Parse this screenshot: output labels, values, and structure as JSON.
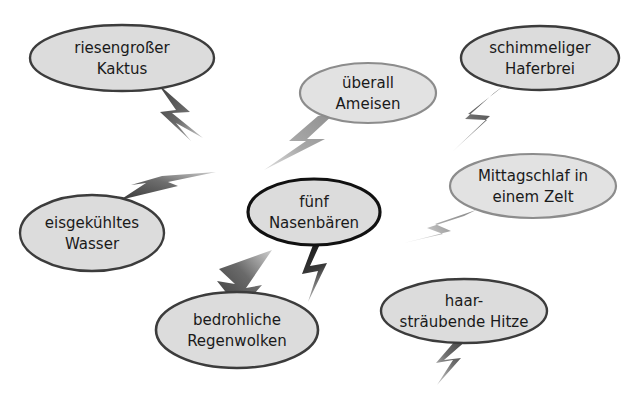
{
  "page": {
    "background_color": "#ffffff",
    "width": 631,
    "height": 401
  },
  "palette": {
    "bubble_fill": "#dcdcdc",
    "bubble_fill_light": "#e2e2e2",
    "border_dark": "#3c3c3c",
    "border_black": "#111111",
    "border_gray": "#8c8c8c",
    "bolt_dark": "#3f3f3f",
    "bolt_black": "#141414",
    "bolt_gray": "#8f8f8f",
    "text_color": "#1a1a1a"
  },
  "bubbles": [
    {
      "id": "riesengrosser-kaktus",
      "lines": [
        "riesengroßer",
        "Kaktus"
      ],
      "cx": 122,
      "cy": 58,
      "rx": 92,
      "ry": 33,
      "font_size": 15,
      "border_color": "#3c3c3c",
      "border_width": 2.4,
      "fill": "#dcdcdc"
    },
    {
      "id": "ueberall-ameisen",
      "lines": [
        "überall",
        "Ameisen"
      ],
      "cx": 368,
      "cy": 93,
      "rx": 68,
      "ry": 30,
      "font_size": 15,
      "border_color": "#8c8c8c",
      "border_width": 2.2,
      "fill": "#e2e2e2"
    },
    {
      "id": "schimmeliger-haferbrei",
      "lines": [
        "schimmeliger",
        "Haferbrei"
      ],
      "cx": 540,
      "cy": 58,
      "rx": 79,
      "ry": 32,
      "font_size": 15,
      "border_color": "#3c3c3c",
      "border_width": 2.4,
      "fill": "#dcdcdc"
    },
    {
      "id": "mittagschlaf-im-zelt",
      "lines": [
        "Mittagschlaf in",
        "einem Zelt"
      ],
      "cx": 533,
      "cy": 186,
      "rx": 83,
      "ry": 32,
      "font_size": 15,
      "border_color": "#8c8c8c",
      "border_width": 2.2,
      "fill": "#e2e2e2"
    },
    {
      "id": "fuenf-nasenbaeren",
      "lines": [
        "fünf",
        "Nasenbären"
      ],
      "cx": 314,
      "cy": 212,
      "rx": 66,
      "ry": 33,
      "font_size": 15,
      "border_color": "#111111",
      "border_width": 3.2,
      "fill": "#dcdcdc"
    },
    {
      "id": "eisgekuehltes-wasser",
      "lines": [
        "eisgekühltes",
        "Wasser"
      ],
      "cx": 92,
      "cy": 233,
      "rx": 72,
      "ry": 38,
      "font_size": 15,
      "border_color": "#3c3c3c",
      "border_width": 2.4,
      "fill": "#dcdcdc"
    },
    {
      "id": "bedrohliche-regenwolken",
      "lines": [
        "bedrohliche",
        "Regenwolken"
      ],
      "cx": 237,
      "cy": 330,
      "rx": 81,
      "ry": 38,
      "font_size": 15,
      "border_color": "#3c3c3c",
      "border_width": 2.6,
      "fill": "#dcdcdc"
    },
    {
      "id": "haarstraeubende-hitze",
      "lines": [
        "haar-",
        "sträubende Hitze"
      ],
      "cx": 464,
      "cy": 311,
      "rx": 83,
      "ry": 32,
      "font_size": 15,
      "border_color": "#3c3c3c",
      "border_width": 2.4,
      "fill": "#dcdcdc"
    }
  ],
  "bolts": [
    {
      "id": "bolt-kaktus",
      "from": "riesengrosser-kaktus",
      "color": "#3f3f3f",
      "fade_color": "#c8c8c8",
      "points": "158,84 190,112 172,113 203,138 176,123 191,141 160,112 176,110",
      "gradient": "g-diag-dr"
    },
    {
      "id": "bolt-ameisen",
      "from": "ueberall-ameisen",
      "color": "#8f8f8f",
      "fade_color": "#dadada",
      "points": "335,113 307,139 325,139 264,170 306,141 289,141 318,116",
      "gradient": "g-diag-dl-gray"
    },
    {
      "id": "bolt-haferbrei",
      "from": "schimmeliger-haferbrei",
      "color": "#3f3f3f",
      "fade_color": "#d0d0d0",
      "points": "506,84 468,114 490,116 452,152 487,120 465,119 494,93",
      "gradient": "g-diag-dl"
    },
    {
      "id": "bolt-zelt",
      "from": "mittagschlaf-im-zelt",
      "color": "#8f8f8f",
      "fade_color": "#dcdcdc",
      "points": "476,210 435,224 451,231 404,243 443,234 427,228 464,216",
      "gradient": "g-horiz-l-gray"
    },
    {
      "id": "bolt-nasenbaeren",
      "from": "fuenf-nasenbaeren",
      "color": "#141414",
      "fade_color": "#9a9a9a",
      "points": "320,244 310,266 327,263 308,302 318,271 302,274 313,245",
      "gradient": "g-vert-d"
    },
    {
      "id": "bolt-regenwolken",
      "to": "bedrohliche-regenwolken",
      "color": "#3f3f3f",
      "fade_color": "#cfcfcf",
      "points": "272,250 246,288 262,285 240,310 217,281 235,284 219,269",
      "gradient": "g-arrow-down"
    },
    {
      "id": "bolt-wasser",
      "to": "eisgekuehltes-wasser",
      "color": "#3f3f3f",
      "fade_color": "#d2d2d2",
      "points": "216,172 168,182 178,186 120,200 146,183 131,185 162,176",
      "gradient": "g-arrow-upleft"
    },
    {
      "id": "bolt-hitze",
      "from": "haarstraeubende-hitze",
      "color": "#3f3f3f",
      "fade_color": "#cdcdcd",
      "points": "467,340 444,360 461,358 437,385 453,360 436,363 455,341",
      "gradient": "g-diag-dl2"
    }
  ]
}
